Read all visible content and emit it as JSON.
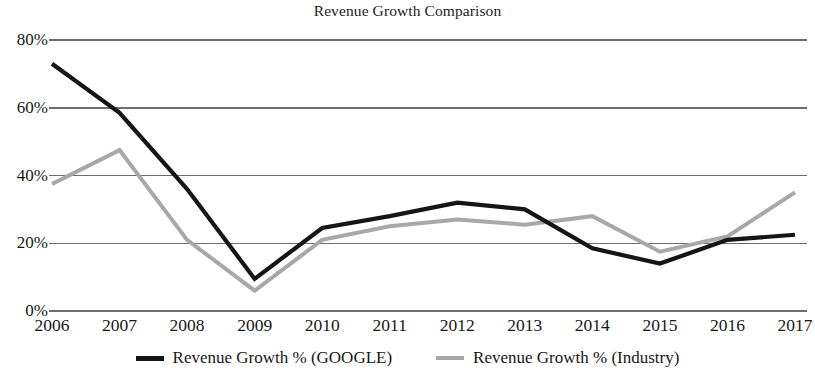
{
  "chart_data": {
    "type": "line",
    "title": "Revenue Growth Comparison",
    "xlabel": "",
    "ylabel": "",
    "categories": [
      "2006",
      "2007",
      "2008",
      "2009",
      "2010",
      "2011",
      "2012",
      "2013",
      "2014",
      "2015",
      "2016",
      "2017"
    ],
    "x": [
      2006,
      2007,
      2008,
      2009,
      2010,
      2011,
      2012,
      2013,
      2014,
      2015,
      2016,
      2017
    ],
    "series": [
      {
        "name": "Revenue Growth % (GOOGLE)",
        "color": "#151515",
        "values": [
          73,
          58.5,
          36,
          9.5,
          24.5,
          28,
          32,
          30,
          18.5,
          14,
          21,
          22.5
        ]
      },
      {
        "name": "Revenue Growth % (Industry)",
        "color": "#a8a8a8",
        "values": [
          37.5,
          47.5,
          21,
          6,
          21,
          25,
          27,
          25.5,
          28,
          17.5,
          22,
          35
        ]
      }
    ],
    "ylim": [
      0,
      80
    ],
    "yticks": [
      0,
      20,
      40,
      60,
      80
    ],
    "ytick_labels": [
      "0%",
      "20%",
      "40%",
      "60%",
      "80%"
    ],
    "grid": true,
    "grid_axis": "y",
    "grid_color": "#6e6e6e",
    "legend_position": "bottom",
    "legend": [
      {
        "label": "Revenue Growth % (GOOGLE)",
        "color": "#151515"
      },
      {
        "label": "Revenue Growth % (Industry)",
        "color": "#a8a8a8"
      }
    ]
  }
}
